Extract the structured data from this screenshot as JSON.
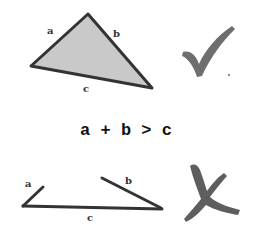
{
  "diagram": {
    "valid_triangle": {
      "labels": {
        "a": "a",
        "b": "b",
        "c": "c"
      },
      "fill_color": "#c8c8c8",
      "stroke_color": "#333333",
      "result": "valid",
      "result_icon": "check-icon"
    },
    "equation": "a + b > c",
    "invalid_triangle": {
      "labels": {
        "a": "a",
        "b": "b",
        "c": "c"
      },
      "stroke_color": "#333333",
      "result": "invalid",
      "result_icon": "cross-icon"
    },
    "mark_color": "#6e6e6e"
  }
}
